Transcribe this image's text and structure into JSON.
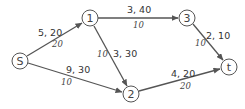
{
  "diagram": {
    "type": "network-flow",
    "colors": {
      "stroke": "#555555",
      "text": "#333333",
      "background": "#ffffff"
    },
    "nodes": [
      {
        "id": "S",
        "label": "S",
        "x": 20,
        "y": 61
      },
      {
        "id": "1",
        "label": "1",
        "x": 90,
        "y": 18
      },
      {
        "id": "3",
        "label": "3",
        "x": 187,
        "y": 18
      },
      {
        "id": "2",
        "label": "2",
        "x": 131,
        "y": 94
      },
      {
        "id": "t",
        "label": "t",
        "x": 229,
        "y": 67
      }
    ],
    "edges": [
      {
        "from": "S",
        "to": "1",
        "label": "5, 20",
        "flow": "20"
      },
      {
        "from": "S",
        "to": "2",
        "label": "9, 30",
        "flow": "10"
      },
      {
        "from": "1",
        "to": "3",
        "label": "3, 40",
        "flow": "10"
      },
      {
        "from": "1",
        "to": "2",
        "label": "3, 30",
        "flow": "10"
      },
      {
        "from": "3",
        "to": "t",
        "label": "2, 10",
        "flow": "10"
      },
      {
        "from": "2",
        "to": "t",
        "label": "4, 20",
        "flow": "20"
      }
    ]
  }
}
